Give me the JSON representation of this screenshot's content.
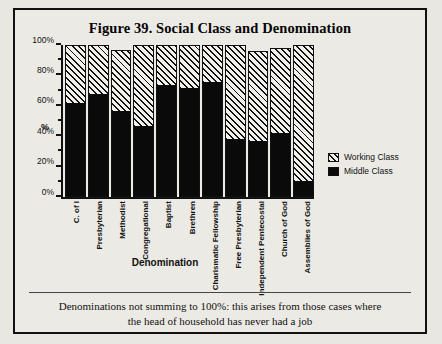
{
  "figure": {
    "title": "Figure 39. Social Class and Denomination",
    "caption_line_1": "Denominations not summing to 100%: this arises from those cases where",
    "caption_line_2": "the head of household has never had a job"
  },
  "legend": {
    "items": [
      {
        "label": "Working Class",
        "pattern": "hatch"
      },
      {
        "label": "Middle Class",
        "pattern": "solid"
      }
    ]
  },
  "chart_data": {
    "type": "bar",
    "stacked": true,
    "title": "Figure 39. Social Class and Denomination",
    "xlabel": "Denomination",
    "ylabel": "%",
    "ylim": [
      0,
      100
    ],
    "ytick_labels": [
      "0%",
      "20%",
      "40%",
      "60%",
      "80%",
      "100%"
    ],
    "ytick_values": [
      0,
      20,
      40,
      60,
      80,
      100
    ],
    "minor_tick_values": [
      10,
      30,
      50,
      70,
      90
    ],
    "grid": false,
    "legend_position": "right",
    "categories": [
      "C. of I",
      "Presbyterian",
      "Methodist",
      "Congregational",
      "Baptist",
      "Brethren",
      "Charismatic Fellowship",
      "Free Presbyterian",
      "Independent Pentecostal",
      "Church of God",
      "Assemblies of God"
    ],
    "series": [
      {
        "name": "Middle Class",
        "pattern": "solid",
        "values": [
          62,
          68,
          57,
          47,
          74,
          72,
          76,
          38,
          37,
          42,
          10
        ]
      },
      {
        "name": "Working Class",
        "pattern": "hatch",
        "values": [
          38,
          32,
          40,
          53,
          26,
          28,
          24,
          62,
          59,
          56,
          90
        ]
      }
    ],
    "totals": [
      100,
      100,
      97,
      100,
      100,
      100,
      100,
      100,
      96,
      98,
      100
    ]
  }
}
